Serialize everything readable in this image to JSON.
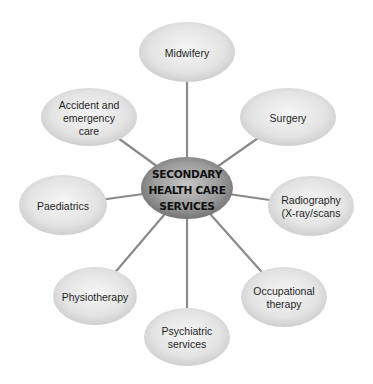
{
  "diagram": {
    "hub": {
      "lines": [
        "SECONDARY",
        "HEALTH CARE",
        "SERVICES"
      ],
      "cx": 187,
      "cy": 188,
      "rx": 46,
      "ry": 31
    },
    "nodes": [
      {
        "id": "midwifery",
        "lines": [
          "Midwifery"
        ],
        "cx": 187,
        "cy": 52,
        "rx": 48,
        "ry": 30
      },
      {
        "id": "surgery",
        "lines": [
          "Surgery"
        ],
        "cx": 288,
        "cy": 117,
        "rx": 48,
        "ry": 29
      },
      {
        "id": "radiography",
        "lines": [
          "Radiography",
          "(X-ray/scans"
        ],
        "cx": 311,
        "cy": 206,
        "rx": 43,
        "ry": 30
      },
      {
        "id": "occupational-therapy",
        "lines": [
          "Occupational",
          "therapy"
        ],
        "cx": 284,
        "cy": 297,
        "rx": 43,
        "ry": 30
      },
      {
        "id": "psychiatric-services",
        "lines": [
          "Psychiatric",
          "services"
        ],
        "cx": 187,
        "cy": 337,
        "rx": 43,
        "ry": 29
      },
      {
        "id": "physiotherapy",
        "lines": [
          "Physiotherapy"
        ],
        "cx": 95,
        "cy": 296,
        "rx": 42,
        "ry": 29
      },
      {
        "id": "paediatrics",
        "lines": [
          "Paediatrics"
        ],
        "cx": 63,
        "cy": 205,
        "rx": 44,
        "ry": 30
      },
      {
        "id": "accident-emergency",
        "lines": [
          "Accident and",
          "emergency",
          "care"
        ],
        "cx": 89,
        "cy": 117,
        "rx": 48,
        "ry": 29
      }
    ],
    "colors": {
      "node_light": "#f4f4f4",
      "node_dark": "#c9c9c9",
      "hub_light": "#c4c4c4",
      "hub_dark": "#6e6e6e",
      "connector": "#8a8a8a",
      "text": "#1f1f1f"
    }
  }
}
